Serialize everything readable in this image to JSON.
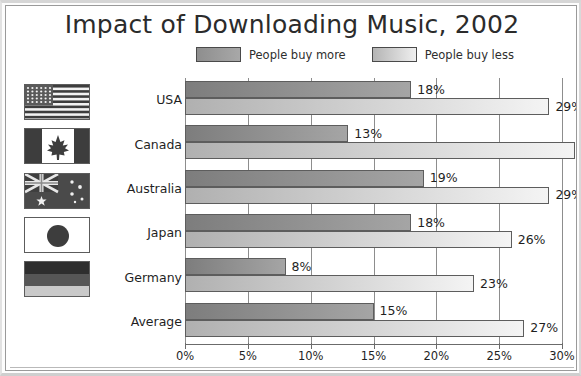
{
  "chart_data": {
    "type": "bar",
    "orientation": "horizontal",
    "title": "Impact of Downloading Music, 2002",
    "xlabel": "",
    "ylabel": "",
    "xlim": [
      0,
      30
    ],
    "xunit": "%",
    "grid": true,
    "legend_position": "top",
    "categories": [
      "USA",
      "Canada",
      "Australia",
      "Japan",
      "Germany",
      "Average"
    ],
    "series": [
      {
        "name": "People buy more",
        "color": "#8e8e8e",
        "values": [
          18,
          13,
          19,
          18,
          8,
          15
        ],
        "value_labels": [
          "18%",
          "13%",
          "19%",
          "18%",
          "8%",
          "15%"
        ]
      },
      {
        "name": "People buy less",
        "color": "#d0d0d0",
        "values": [
          29,
          31,
          29,
          26,
          23,
          27
        ],
        "value_labels": [
          "29%",
          "31%",
          "29%",
          "26%",
          "23%",
          "27%"
        ]
      }
    ],
    "xticks": [
      0,
      5,
      10,
      15,
      20,
      25,
      30
    ],
    "xtick_labels": [
      "0%",
      "5%",
      "10%",
      "15%",
      "20%",
      "25%",
      "30%"
    ]
  },
  "legend": {
    "items": [
      {
        "label": "People buy more",
        "swatch": "more"
      },
      {
        "label": "People buy less",
        "swatch": "less"
      }
    ]
  },
  "flags": [
    {
      "country": "USA",
      "icon": "flag-usa"
    },
    {
      "country": "Canada",
      "icon": "flag-canada"
    },
    {
      "country": "Australia",
      "icon": "flag-australia"
    },
    {
      "country": "Japan",
      "icon": "flag-japan"
    },
    {
      "country": "Germany",
      "icon": "flag-germany"
    },
    {
      "country": "Average",
      "icon": "none"
    }
  ],
  "colors": {
    "buy_more": "#8e8e8e",
    "buy_less": "#d0d0d0",
    "axis": "#6b6b6b",
    "grid": "#8d8d8d",
    "text": "#1f1f1f"
  }
}
